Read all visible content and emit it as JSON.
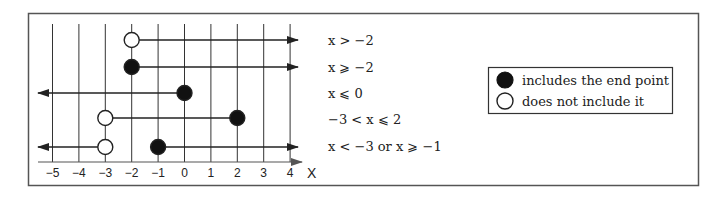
{
  "diagram": {
    "number_line": {
      "ticks": [
        -5,
        -4,
        -3,
        -2,
        -1,
        0,
        1,
        2,
        3,
        4
      ],
      "tick_labels": [
        "−5",
        "−4",
        "−3",
        "−2",
        "−1",
        "0",
        "1",
        "2",
        "3",
        "4"
      ],
      "axis_label": "X"
    },
    "rows": [
      {
        "inequality": "x > −2",
        "segments": [
          {
            "from": -2,
            "to": "right",
            "from_closed": false
          }
        ]
      },
      {
        "inequality": "x ⩾ −2",
        "segments": [
          {
            "from": -2,
            "to": "right",
            "from_closed": true
          }
        ]
      },
      {
        "inequality": "x ⩽ 0",
        "segments": [
          {
            "from": "left",
            "to": 0,
            "to_closed": true
          }
        ]
      },
      {
        "inequality": "−3 < x ⩽ 2",
        "segments": [
          {
            "from": -3,
            "to": 2,
            "from_closed": false,
            "to_closed": true
          }
        ]
      },
      {
        "inequality": "x < −3 or x ⩾ −1",
        "segments": [
          {
            "from": "left",
            "to": -3,
            "to_closed": false
          },
          {
            "from": -1,
            "to": "right",
            "from_closed": true
          }
        ]
      }
    ],
    "legend": {
      "items": [
        {
          "icon": "filled-circle-icon",
          "label": "includes the end point"
        },
        {
          "icon": "open-circle-icon",
          "label": "does not include it"
        }
      ]
    },
    "colors": {
      "line": "#222222",
      "frame": "#555555",
      "fill": "#111111",
      "background": "#ffffff"
    }
  }
}
